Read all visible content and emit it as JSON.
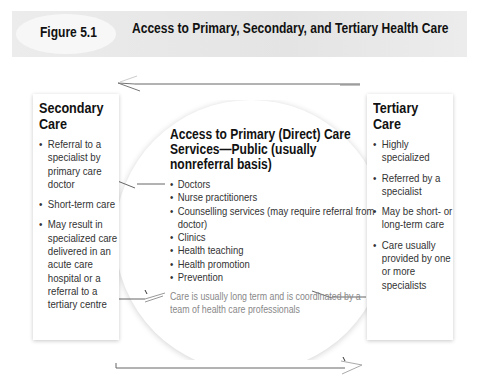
{
  "header": {
    "figure_label": "Figure 5.1",
    "title": "Access to Primary, Secondary, and Tertiary Health Care"
  },
  "secondary": {
    "title": "Secondary Care",
    "items": [
      "Referral to a specialist by primary care doctor",
      "Short-term care",
      "May result in specialized care delivered in an acute care hospital or a referral to a tertiary centre"
    ]
  },
  "primary": {
    "title": "Access to Primary (Direct) Care Services—Public (usually nonreferral basis)",
    "items": [
      "Doctors",
      "Nurse practitioners",
      "Counselling services (may require referral from doctor)",
      "Clinics",
      "Health teaching",
      "Health promotion",
      "Prevention"
    ],
    "note": "Care is usually long term and is coordinated by a team of health care professionals"
  },
  "tertiary": {
    "title": "Tertiary Care",
    "items": [
      "Highly specialized",
      "Referred by a specialist",
      "May be short- or long-term care",
      "Care usually provided by one or more specialists"
    ]
  }
}
